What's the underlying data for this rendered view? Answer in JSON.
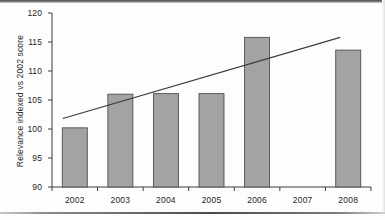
{
  "chart_data": {
    "type": "bar",
    "title": "",
    "subtitle": "",
    "xlabel": "",
    "ylabel": "Relevance indexed vs 2002 score",
    "categories": [
      "2002",
      "2003",
      "2004",
      "2005",
      "2006",
      "2007",
      "2008"
    ],
    "values": [
      100.2,
      106.0,
      106.1,
      106.1,
      115.8,
      null,
      113.6
    ],
    "series": [
      {
        "name": "Relevance indexed vs 2002 score",
        "values": [
          100.2,
          106.0,
          106.1,
          106.1,
          115.8,
          null,
          113.6
        ]
      },
      {
        "name": "trendline",
        "type": "line",
        "x": [
          "2002",
          "2008"
        ],
        "values": [
          101.8,
          115.8
        ]
      }
    ],
    "ylim": [
      90,
      120
    ],
    "yticks": [
      90,
      95,
      100,
      105,
      110,
      115,
      120
    ],
    "ytick_labels": [
      "90",
      "95",
      "100",
      "105",
      "110",
      "115",
      "120"
    ],
    "xlim": [
      0,
      7
    ],
    "grid": false,
    "legend": false,
    "legend_position": "none",
    "annotations": [],
    "colors": {
      "bar_fill": "#a3a3a3",
      "bar_border": "#4f4f4f",
      "axis": "#3c3c3c",
      "trendline": "#3a3a3a",
      "text": "#1f1f1f",
      "background": "#fdfdfd"
    }
  }
}
